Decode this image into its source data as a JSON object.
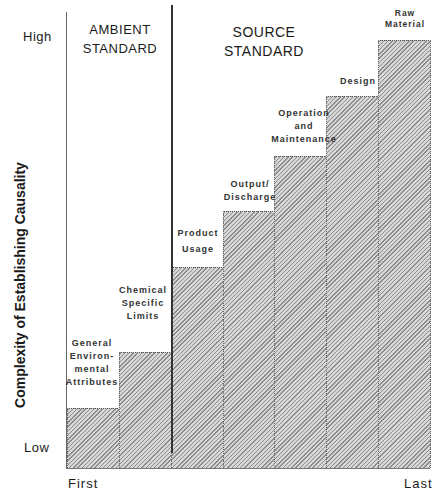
{
  "chart_data": {
    "type": "bar",
    "title": "",
    "xlabel": "",
    "ylabel": "Complexity of Establishing Causality",
    "x_axis_ends": {
      "start": "First",
      "end": "Last"
    },
    "y_axis_ends": {
      "low": "Low",
      "high": "High"
    },
    "ylim": [
      0,
      10
    ],
    "grid": false,
    "legend": null,
    "regions": [
      {
        "name": "AMBIENT STANDARD",
        "line1": "AMBIENT",
        "line2": "STANDARD",
        "categories": [
          0,
          1
        ]
      },
      {
        "name": "SOURCE STANDARD",
        "line1": "SOURCE",
        "line2": "STANDARD",
        "categories": [
          2,
          3,
          4,
          5,
          6
        ]
      }
    ],
    "categories": [
      "General Environmental Attributes",
      "Chemical Specific Limits",
      "Product Usage",
      "Output/ Discharge",
      "Operation and Maintenance",
      "Design",
      "Raw Material"
    ],
    "category_label_lines": [
      [
        "General",
        "Environ-",
        "mental",
        "Attributes"
      ],
      [
        "Chemical",
        "Specific",
        "Limits"
      ],
      [
        "Product",
        "Usage"
      ],
      [
        "Output/",
        "Discharge"
      ],
      [
        "Operation",
        "and",
        "Maintenance"
      ],
      [
        "Design"
      ],
      [
        "Raw",
        "Material"
      ]
    ],
    "values": [
      1.4,
      2.7,
      4.7,
      6.0,
      7.3,
      8.7,
      10.0
    ],
    "bar_fill": "#c9c9c9",
    "divider_color": "#333333"
  }
}
